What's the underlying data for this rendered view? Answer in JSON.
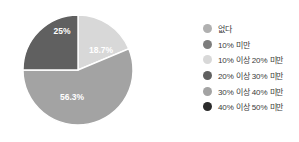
{
  "chart_data": {
    "type": "pie",
    "title": "",
    "subtitle": "",
    "xlabel": "",
    "ylabel": "",
    "grid": false,
    "legend_position": "right",
    "start_angle_deg": 0,
    "direction": "clockwise",
    "categories": [
      "없다",
      "10% 미만",
      "10% 이상 20% 미만",
      "20% 이상 30% 미만",
      "30% 이상 40% 미만",
      "40% 이상 50% 미만"
    ],
    "values": [
      0,
      0,
      18.7,
      25,
      56.3,
      0
    ],
    "colors": [
      "#b0b0b0",
      "#7d7d7d",
      "#d8d8d8",
      "#606060",
      "#a3a3a3",
      "#2b2b2b"
    ],
    "visible_slices": [
      {
        "category": "10% 이상 20% 미만",
        "value": 18.7,
        "label": "18.7%",
        "color": "#d8d8d8",
        "start_deg": 0,
        "end_deg": 67.32,
        "label_x": 101,
        "label_y": 51
      },
      {
        "category": "30% 이상 40% 미만",
        "value": 56.3,
        "label": "56.3%",
        "color": "#a3a3a3",
        "start_deg": 67.32,
        "end_deg": 270,
        "label_x": 72,
        "label_y": 98
      },
      {
        "category": "20% 이상 30% 미만",
        "value": 25,
        "label": "25%",
        "color": "#606060",
        "start_deg": 270,
        "end_deg": 360,
        "label_x": 62,
        "label_y": 32
      }
    ],
    "center_x": 78,
    "center_y": 70,
    "radius": 55
  },
  "legend": {
    "items": [
      {
        "label": "없다",
        "color": "#b0b0b0"
      },
      {
        "label": "10% 미만",
        "color": "#7d7d7d"
      },
      {
        "label": "10% 이상 20% 미만",
        "color": "#d8d8d8"
      },
      {
        "label": "20% 이상 30% 미만",
        "color": "#606060"
      },
      {
        "label": "30% 이상 40% 미만",
        "color": "#a3a3a3"
      },
      {
        "label": "40% 이상 50% 미만",
        "color": "#2b2b2b"
      }
    ]
  },
  "slice_labels": {
    "top_right": "18.7%",
    "top_left": "25%",
    "bottom": "56.3%"
  }
}
